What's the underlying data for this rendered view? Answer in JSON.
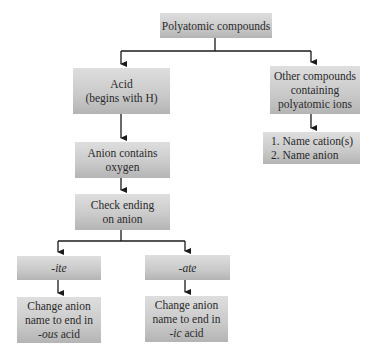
{
  "diagram": {
    "title": "Polyatomic compounds",
    "nodes": {
      "root": {
        "lines": [
          "Polyatomic compounds"
        ]
      },
      "acid": {
        "lines": [
          "Acid",
          "(begins with H)"
        ]
      },
      "other": {
        "lines": [
          "Other compounds",
          "containing",
          "polyatomic ions"
        ]
      },
      "naming": {
        "lines": [
          "1.  Name cation(s)",
          "2.  Name anion"
        ]
      },
      "anion_oxygen": {
        "lines": [
          "Anion contains",
          "oxygen"
        ]
      },
      "check_ending": {
        "lines": [
          "Check ending",
          "on anion"
        ]
      },
      "ite": {
        "lines": [
          "-ite"
        ]
      },
      "ate": {
        "lines": [
          "-ate"
        ]
      },
      "ous_acid": {
        "lines": [
          "Change anion",
          "name to end in"
        ],
        "suffix_italic": "-ous",
        "suffix_rest": " acid"
      },
      "ic_acid": {
        "lines": [
          "Change anion",
          "name to end in"
        ],
        "suffix_italic": "-ic",
        "suffix_rest": " acid"
      }
    },
    "edges": [
      [
        "root",
        "acid"
      ],
      [
        "root",
        "other"
      ],
      [
        "other",
        "naming"
      ],
      [
        "acid",
        "anion_oxygen"
      ],
      [
        "anion_oxygen",
        "check_ending"
      ],
      [
        "check_ending",
        "ite"
      ],
      [
        "check_ending",
        "ate"
      ],
      [
        "ite",
        "ous_acid"
      ],
      [
        "ate",
        "ic_acid"
      ]
    ],
    "colors": {
      "box_top": "#dedede",
      "box_bottom": "#b4b4b4",
      "line": "#1a1a1a"
    }
  }
}
